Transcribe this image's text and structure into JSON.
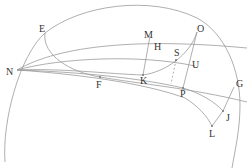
{
  "diagram": {
    "type": "geometric-construction",
    "labels": {
      "E": "E",
      "N": "N",
      "F": "F",
      "O": "O",
      "M": "M",
      "H": "H",
      "K": "K",
      "S": "S",
      "U": "U",
      "P": "P",
      "G": "G",
      "J": "J",
      "L": "L"
    },
    "stroke_color": "#9a9a9a",
    "label_color": "#333333"
  }
}
